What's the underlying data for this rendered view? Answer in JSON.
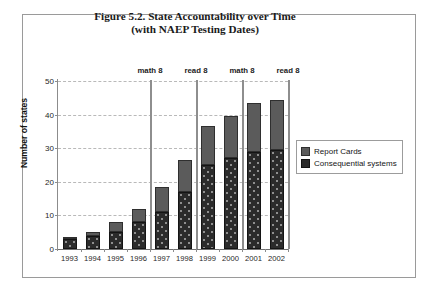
{
  "figure": {
    "title_line1": "Figure 5.2. State Accountability over Time",
    "title_line2": "(with NAEP Testing Dates)"
  },
  "legend": {
    "position": "right",
    "items": [
      {
        "label": "Report Cards",
        "color": "#5b5b5b"
      },
      {
        "label": "Consequential systems",
        "color": "#2b2b2b"
      }
    ]
  },
  "annotations": [
    {
      "label": "math 8",
      "after_category": "1996"
    },
    {
      "label": "read 8",
      "after_category": "1998"
    },
    {
      "label": "math 8",
      "after_category": "2000"
    },
    {
      "label": "read 8",
      "after_category": "2002"
    }
  ],
  "chart_data": {
    "type": "bar",
    "stacked": true,
    "title": "Figure 5.2. State Accountability over Time (with NAEP Testing Dates)",
    "xlabel": "",
    "ylabel": "Number of states",
    "ylim": [
      0,
      50
    ],
    "yticks": [
      0,
      10,
      20,
      30,
      40,
      50
    ],
    "grid": true,
    "categories": [
      "1993",
      "1994",
      "1995",
      "1996",
      "1997",
      "1998",
      "1999",
      "2000",
      "2001",
      "2002"
    ],
    "series": [
      {
        "name": "Consequential systems",
        "color": "#2b2b2b",
        "values": [
          3,
          4,
          5,
          8,
          11,
          17,
          25,
          27,
          29,
          29.5
        ]
      },
      {
        "name": "Report Cards",
        "color": "#5b5b5b",
        "values": [
          0.3,
          1,
          3,
          4,
          7.5,
          9.5,
          11.5,
          12.5,
          14.5,
          15
        ]
      }
    ],
    "totals": [
      3.3,
      5,
      8,
      12,
      18.5,
      26.5,
      36.5,
      39.5,
      43.5,
      44.5
    ],
    "annotations": [
      {
        "text": "math 8",
        "x_between": [
          "1996",
          "1997"
        ]
      },
      {
        "text": "read 8",
        "x_between": [
          "1998",
          "1999"
        ]
      },
      {
        "text": "math 8",
        "x_between": [
          "2000",
          "2001"
        ]
      },
      {
        "text": "read 8",
        "x_after": "2002"
      }
    ]
  }
}
